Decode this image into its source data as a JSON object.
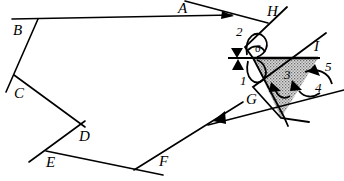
{
  "figure": {
    "kind": "geometry-diagram",
    "background_color": "#ffffff",
    "stroke_color": "#000000",
    "shaded_region_fill": "#b3b3b3",
    "width": 344,
    "height": 181,
    "point_labels": [
      {
        "name": "A",
        "text": "A",
        "x": 178,
        "y": 3
      },
      {
        "name": "B",
        "text": "B",
        "x": 13,
        "y": 26
      },
      {
        "name": "C",
        "text": "C",
        "x": 14,
        "y": 89
      },
      {
        "name": "D",
        "text": "D",
        "x": 79,
        "y": 132
      },
      {
        "name": "E",
        "text": "E",
        "x": 46,
        "y": 158
      },
      {
        "name": "F",
        "text": "F",
        "x": 159,
        "y": 157
      },
      {
        "name": "G",
        "text": "G",
        "x": 246,
        "y": 95
      },
      {
        "name": "H",
        "text": "H",
        "x": 267,
        "y": 7
      },
      {
        "name": "I",
        "text": "I",
        "x": 314,
        "y": 42
      }
    ],
    "angle_labels": [
      {
        "name": "angle-1",
        "text": "1",
        "x": 240,
        "y": 78
      },
      {
        "name": "angle-2",
        "text": "2",
        "x": 236,
        "y": 29
      },
      {
        "name": "angle-3",
        "text": "3",
        "x": 284,
        "y": 72
      },
      {
        "name": "angle-4",
        "text": "4",
        "x": 315,
        "y": 85
      },
      {
        "name": "angle-5",
        "text": "5",
        "x": 325,
        "y": 64
      },
      {
        "name": "angle-6",
        "text": "6",
        "x": 257,
        "y": 46
      }
    ],
    "polyline_path": {
      "name": "zigzag-polyline",
      "description": "open zigzag path through labelled points A B C D E F G",
      "vertices": [
        {
          "x": 187,
          "y": 2
        },
        {
          "x": 230,
          "y": 16
        },
        {
          "x": 38,
          "y": 19
        },
        {
          "x": 38,
          "y": 19
        }
      ]
    },
    "tick_marks": {
      "name": "parallel-arrow-markers",
      "count": 2,
      "description": "two solid arrowhead tick marks on the horizontal transversal near the left of the shaded triangle"
    },
    "arcs": {
      "name": "angle-arcs",
      "count": 6,
      "description": "curved arcs marking angles 1 through 6"
    }
  }
}
